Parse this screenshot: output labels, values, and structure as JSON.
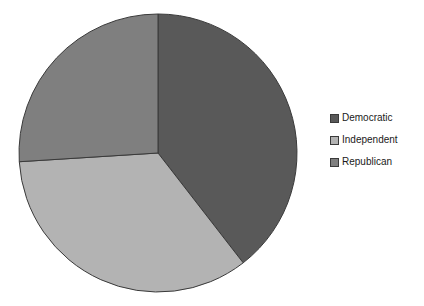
{
  "chart_data": {
    "type": "pie",
    "title": "",
    "labels": [
      "Democratic",
      "Independent",
      "Republican"
    ],
    "values": [
      39.5,
      34.5,
      26.0
    ],
    "colors": [
      "#595959",
      "#b3b3b3",
      "#7f7f7f"
    ],
    "border_color": "#3a3a3a",
    "start_angle_deg": 0,
    "direction": "clockwise",
    "legend": {
      "position": "right",
      "entries": [
        "Democratic",
        "Independent",
        "Republican"
      ]
    },
    "background": "#ffffff",
    "data_labels_shown": false
  }
}
